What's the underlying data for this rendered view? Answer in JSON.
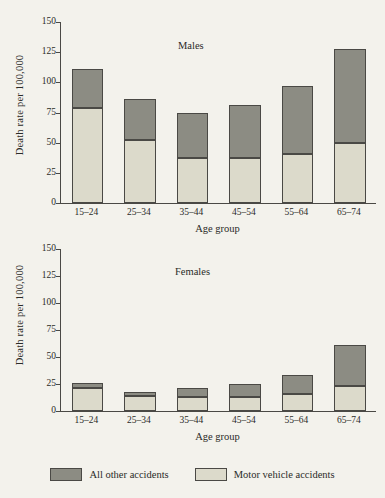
{
  "chart_data": [
    {
      "type": "bar",
      "title": "Males",
      "xlabel": "Age group",
      "ylabel": "Death rate per 100,000",
      "categories": [
        "15–24",
        "25–34",
        "35–44",
        "45–54",
        "55–64",
        "65–74"
      ],
      "series": [
        {
          "name": "Motor vehicle accidents",
          "values": [
            79,
            52,
            37,
            37,
            41,
            50
          ],
          "color": "#dcdacb"
        },
        {
          "name": "All other accidents",
          "values": [
            32,
            34,
            38,
            44,
            56,
            78
          ],
          "color": "#8c8c83"
        }
      ],
      "totals": [
        111,
        86,
        75,
        81,
        97,
        128
      ],
      "ylim": [
        0,
        150
      ],
      "yticks": [
        0,
        25,
        50,
        75,
        100,
        125,
        150
      ],
      "stacked": true,
      "grid": false,
      "legend_position": "below-figure"
    },
    {
      "type": "bar",
      "title": "Females",
      "xlabel": "Age group",
      "ylabel": "Death rate per 100,000",
      "categories": [
        "15–24",
        "25–34",
        "35–44",
        "45–54",
        "55–64",
        "65–74"
      ],
      "series": [
        {
          "name": "Motor vehicle accidents",
          "values": [
            21,
            14,
            13,
            13,
            16,
            23
          ],
          "color": "#dcdacb"
        },
        {
          "name": "All other accidents",
          "values": [
            5,
            4,
            8,
            12,
            17,
            38
          ],
          "color": "#8c8c83"
        }
      ],
      "totals": [
        26,
        18,
        21,
        25,
        33,
        61
      ],
      "ylim": [
        0,
        150
      ],
      "yticks": [
        0,
        25,
        50,
        75,
        100,
        125,
        150
      ],
      "stacked": true,
      "grid": false,
      "legend_position": "below-figure"
    }
  ],
  "legend": {
    "entries": [
      {
        "label": "All other accidents",
        "color": "#8c8c83"
      },
      {
        "label": "Motor vehicle accidents",
        "color": "#dcdacb"
      }
    ]
  },
  "colors": {
    "background": "#f3f2ec",
    "axis": "#4a4945",
    "all_other_accidents": "#8c8c83",
    "motor_vehicle_accidents": "#dcdacb"
  }
}
